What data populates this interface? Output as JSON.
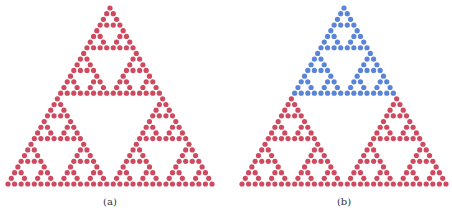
{
  "figure": {
    "panels": [
      {
        "id": "a",
        "caption": "(a)",
        "description": "Sierpinski triangle drawn as dots (Pascal's triangle mod 2)",
        "rows": 32,
        "color_regions": [
          {
            "from_row": 0,
            "to_row": 31,
            "color": "#cf4a5f"
          }
        ]
      },
      {
        "id": "b",
        "caption": "(b)",
        "description": "Same Sierpinski dot triangle with the top half highlighted",
        "rows": 32,
        "color_regions": [
          {
            "from_row": 0,
            "to_row": 15,
            "color": "#5a84d8"
          },
          {
            "from_row": 16,
            "to_row": 31,
            "color": "#cf4a5f"
          }
        ]
      }
    ]
  },
  "colors": {
    "red_dot": "#cf4a5f",
    "blue_dot": "#5a84d8",
    "background": "#ffffff"
  }
}
